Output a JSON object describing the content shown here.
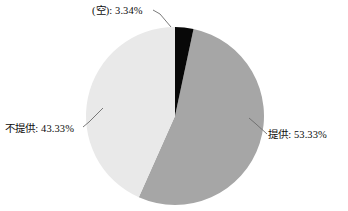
{
  "chart_data": {
    "type": "pie",
    "title": "",
    "subtitle": "",
    "xlabel": "",
    "ylabel": "",
    "legend_position": "none",
    "grid": false,
    "labels_inside": false,
    "label_format": "{name}: {percent}%",
    "categories": [
      "(空)",
      "提供",
      "不提供"
    ],
    "values": [
      3.34,
      53.33,
      43.33
    ],
    "slices": [
      {
        "name": "(空)",
        "percent": 3.34,
        "percent_text": "3.34%",
        "label": "(空): 3.34%",
        "color": "#080808",
        "start_angle_deg": 0.0,
        "end_angle_deg": 12.02
      },
      {
        "name": "提供",
        "percent": 53.33,
        "percent_text": "53.33%",
        "label": "提供: 53.33%",
        "color": "#a6a6a6",
        "start_angle_deg": 12.02,
        "end_angle_deg": 203.99
      },
      {
        "name": "不提供",
        "percent": 43.33,
        "percent_text": "43.33%",
        "label": "不提供: 43.33%",
        "color": "#e9e9e9",
        "start_angle_deg": 203.99,
        "end_angle_deg": 360.0
      }
    ],
    "geometry": {
      "center_x": 175,
      "center_y": 116,
      "radius": 89
    },
    "colors": {
      "background": "#ffffff",
      "text": "#0d0d0d",
      "leader_line": "#595959",
      "slice_blank": "#080808",
      "slice_provided": "#a6a6a6",
      "slice_not_provided": "#e9e9e9"
    }
  },
  "labels": {
    "blank": "(空): 3.34%",
    "provided": "提供: 53.33%",
    "not_provided": "不提供: 43.33%"
  }
}
